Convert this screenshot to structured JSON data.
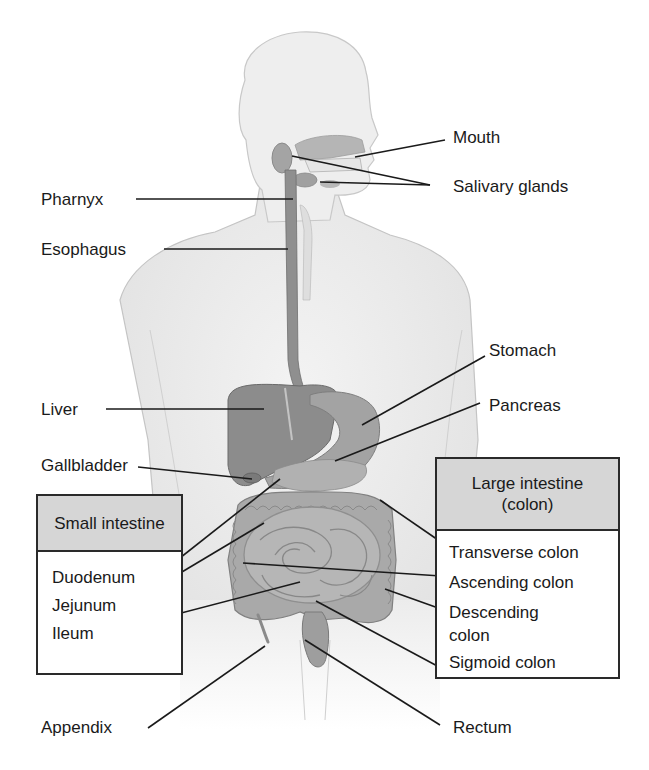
{
  "diagram": {
    "type": "anatomical-labeled-illustration",
    "labels_left": [
      {
        "id": "pharnyx",
        "text": "Pharnyx"
      },
      {
        "id": "esophagus",
        "text": "Esophagus"
      },
      {
        "id": "liver",
        "text": "Liver"
      },
      {
        "id": "gallbladder",
        "text": "Gallbladder"
      },
      {
        "id": "appendix",
        "text": "Appendix"
      }
    ],
    "labels_right": [
      {
        "id": "mouth",
        "text": "Mouth"
      },
      {
        "id": "salivary_glands",
        "text": "Salivary glands"
      },
      {
        "id": "stomach",
        "text": "Stomach"
      },
      {
        "id": "pancreas",
        "text": "Pancreas"
      },
      {
        "id": "rectum",
        "text": "Rectum"
      }
    ],
    "small_intestine_box": {
      "title": "Small intestine",
      "items": [
        "Duodenum",
        "Jejunum",
        "Ileum"
      ]
    },
    "large_intestine_box": {
      "title_line1": "Large intestine",
      "title_line2": "(colon)",
      "items": [
        "Transverse colon",
        "Ascending colon",
        "Descending",
        "colon",
        "Sigmoid colon"
      ]
    },
    "colors": {
      "skin": "#ededed",
      "skin_outline": "#bdbdbd",
      "organ": "#9a9a9a",
      "organ_dark": "#7d7d7d",
      "intestine": "#a8a8a8",
      "box_header": "#d6d6d6",
      "leader_line": "#1a1a1a"
    }
  }
}
